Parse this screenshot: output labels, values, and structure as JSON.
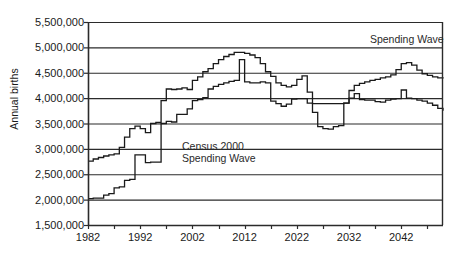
{
  "chart_data": {
    "type": "line",
    "title": "",
    "xlabel": "",
    "ylabel": "Annual births",
    "xlim": [
      1982,
      2050
    ],
    "ylim": [
      1500000,
      5500000
    ],
    "grid": true,
    "legend_position": "inline-annotations",
    "ytick_labels": [
      "5,500,000",
      "5,000,000",
      "4,500,000",
      "4,000,000",
      "3,500,000",
      "3,000,000",
      "2,500,000",
      "2,000,000",
      "1,500,000"
    ],
    "ytick_values": [
      5500000,
      5000000,
      4500000,
      4000000,
      3500000,
      3000000,
      2500000,
      2000000,
      1500000
    ],
    "xtick_labels": [
      "1982",
      "1992",
      "2002",
      "2012",
      "2022",
      "2032",
      "2042"
    ],
    "xtick_values": [
      1982,
      1992,
      2002,
      2012,
      2022,
      2032,
      2042
    ],
    "xtick_minor_values": [
      1987,
      1997,
      2007,
      2017,
      2027,
      2037,
      2047
    ],
    "annotations": [
      {
        "text": "Spending Wave",
        "x": 2036,
        "y": 5150000,
        "name": "spending-wave-top-label"
      },
      {
        "text": "Census 2000",
        "x": 2000,
        "y": 3030000,
        "name": "census-2000-label"
      },
      {
        "text": "Spending Wave",
        "x": 2000,
        "y": 2810000,
        "name": "spending-wave-label"
      }
    ],
    "series": [
      {
        "name": "Census 2000",
        "color": "#1a1a1a",
        "step": true,
        "x": [
          1982,
          1983,
          1984,
          1985,
          1986,
          1987,
          1988,
          1989,
          1990,
          1991,
          1992,
          1993,
          1994,
          1995,
          1996,
          1997,
          1998,
          1999,
          2000,
          2001,
          2002,
          2003,
          2004,
          2005,
          2006,
          2007,
          2008,
          2009,
          2010,
          2011,
          2012,
          2013,
          2014,
          2015,
          2016,
          2017,
          2018,
          2019,
          2020,
          2021,
          2022,
          2023,
          2024,
          2025,
          2026,
          2027,
          2028,
          2029,
          2030,
          2031,
          2032,
          2033,
          2034,
          2035,
          2036,
          2037,
          2038,
          2039,
          2040,
          2041,
          2042,
          2043,
          2044,
          2045,
          2046,
          2047,
          2048,
          2049,
          2050
        ],
        "y": [
          2760000,
          2800000,
          2830000,
          2860000,
          2880000,
          2900000,
          3030000,
          3230000,
          3400000,
          3450000,
          3400000,
          3320000,
          3500000,
          3520000,
          3950000,
          4180000,
          4170000,
          4180000,
          4200000,
          4170000,
          4350000,
          4420000,
          4520000,
          4580000,
          4680000,
          4760000,
          4820000,
          4860000,
          4900000,
          4900000,
          4880000,
          4850000,
          4800000,
          4680000,
          4520000,
          4430000,
          4300000,
          4250000,
          4220000,
          4250000,
          4370000,
          4440000,
          4120000,
          3720000,
          3440000,
          3400000,
          3390000,
          3440000,
          3460000,
          3900000,
          4150000,
          4250000,
          4290000,
          4320000,
          4350000,
          4370000,
          4400000,
          4420000,
          4460000,
          4560000,
          4680000,
          4700000,
          4650000,
          4550000,
          4480000,
          4450000,
          4420000,
          4400000,
          4410000
        ]
      },
      {
        "name": "Spending Wave",
        "color": "#1a1a1a",
        "step": true,
        "x": [
          1982,
          1983,
          1984,
          1985,
          1986,
          1987,
          1988,
          1989,
          1990,
          1991,
          1992,
          1993,
          1994,
          1995,
          1996,
          1997,
          1998,
          1999,
          2000,
          2001,
          2002,
          2003,
          2004,
          2005,
          2006,
          2007,
          2008,
          2009,
          2010,
          2011,
          2012,
          2013,
          2014,
          2015,
          2016,
          2017,
          2018,
          2019,
          2020,
          2021,
          2022,
          2023,
          2024,
          2025,
          2026,
          2027,
          2028,
          2029,
          2030,
          2031,
          2032,
          2033,
          2034,
          2035,
          2036,
          2037,
          2038,
          2039,
          2040,
          2041,
          2042,
          2043,
          2044,
          2045,
          2046,
          2047,
          2048,
          2049,
          2050
        ],
        "y": [
          2020000,
          2030000,
          2030000,
          2090000,
          2120000,
          2230000,
          2250000,
          2380000,
          2400000,
          2880000,
          2880000,
          2730000,
          2740000,
          2740000,
          3500000,
          3540000,
          3530000,
          3680000,
          3680000,
          3790000,
          3950000,
          3970000,
          4010000,
          4180000,
          4230000,
          4270000,
          4300000,
          4330000,
          4350000,
          4760000,
          4320000,
          4300000,
          4300000,
          4320000,
          4300000,
          3940000,
          3890000,
          3840000,
          3880000,
          3980000,
          3990000,
          3990000,
          3900000,
          3890000,
          3890000,
          3890000,
          3890000,
          3890000,
          3890000,
          3900000,
          4000000,
          4090000,
          3970000,
          3960000,
          3960000,
          3930000,
          3920000,
          3960000,
          3980000,
          3990000,
          4160000,
          4000000,
          3990000,
          3960000,
          3940000,
          3900000,
          3860000,
          3800000,
          3750000
        ]
      }
    ]
  }
}
